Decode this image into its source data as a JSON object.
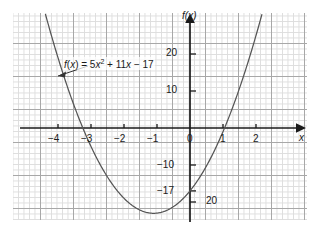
{
  "figure": {
    "kind": "cartesian-graph",
    "background": "#ffffff",
    "grid": {
      "visible": true,
      "minor_color": "#d8d8d8",
      "major_color": "#9a9a9a",
      "minor_step_px": 5.5,
      "major_step_px": 33
    },
    "curve_color": "#555555",
    "axis_color": "#1a1a1a"
  },
  "chart_data": {
    "type": "line",
    "title": "",
    "subtitle": "",
    "xlabel": "x",
    "ylabel": "f(x)",
    "function_label": "f(x) = 5x² + 11x − 17",
    "equation": {
      "lhs": "f(x)",
      "equals": "=",
      "a": 5,
      "term1": "5x",
      "exponent": "2",
      "term2": "+ 11x",
      "term3": "− 17"
    },
    "coefficients": {
      "a": 5,
      "b": 11,
      "c": -17
    },
    "vertex": {
      "x": -1.1,
      "y": -23.05
    },
    "roots": [
      -3.299,
      1.099
    ],
    "y_intercept": -17,
    "xlim": [
      -4.45,
      2.65
    ],
    "ylim": [
      -25.5,
      28.5
    ],
    "grid": true,
    "legend": "none",
    "x_ticks": [
      {
        "value": -4,
        "label": "−4"
      },
      {
        "value": -3,
        "label": "−3"
      },
      {
        "value": -2,
        "label": "−2"
      },
      {
        "value": -1,
        "label": "−1"
      },
      {
        "value": 0,
        "label": "0"
      },
      {
        "value": 1,
        "label": "1"
      },
      {
        "value": 2,
        "label": "2"
      }
    ],
    "y_ticks": [
      {
        "value": 20,
        "label": "20"
      },
      {
        "value": 10,
        "label": "10"
      },
      {
        "value": -10,
        "label": "−10"
      },
      {
        "value": -17,
        "label": "−17"
      },
      {
        "value": -20,
        "label": "20"
      }
    ],
    "annotations": [
      {
        "name": "function-callout",
        "text": "f(x) = 5x² + 11x − 17",
        "points_to": {
          "x": -3.55,
          "y": 13.5
        }
      }
    ],
    "x_axis_arrow": true,
    "y_axis_arrow": true,
    "series": [
      {
        "name": "f(x) = 5x² + 11x − 17",
        "color": "#555555",
        "points": [
          {
            "x": -4.4,
            "y": 31.2
          },
          {
            "x": -4.0,
            "y": 19.0
          },
          {
            "x": -3.5,
            "y": 5.75
          },
          {
            "x": -3.3,
            "y": -0.85
          },
          {
            "x": -3.0,
            "y": -5.0
          },
          {
            "x": -2.5,
            "y": -13.25
          },
          {
            "x": -2.0,
            "y": -19.0
          },
          {
            "x": -1.5,
            "y": -22.25
          },
          {
            "x": -1.1,
            "y": -23.05
          },
          {
            "x": -1.0,
            "y": -23.0
          },
          {
            "x": -0.5,
            "y": -21.25
          },
          {
            "x": 0.0,
            "y": -17.0
          },
          {
            "x": 0.5,
            "y": -10.25
          },
          {
            "x": 1.0,
            "y": -1.0
          },
          {
            "x": 1.1,
            "y": 1.15
          },
          {
            "x": 1.5,
            "y": 10.75
          },
          {
            "x": 2.0,
            "y": 25.0
          },
          {
            "x": 2.25,
            "y": 32.9
          }
        ]
      }
    ]
  }
}
